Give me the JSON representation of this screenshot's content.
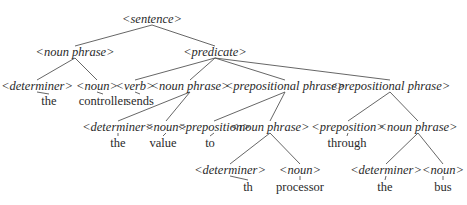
{
  "diagram": {
    "title": "",
    "type": "parse-tree",
    "line_color": "#555555",
    "text_color": "#2a2a2a",
    "nodes": [
      {
        "id": "s",
        "label": "<sentence>",
        "kind": "nt",
        "x": 152,
        "y": 19,
        "parent": null
      },
      {
        "id": "np1",
        "label": "<noun phrase>",
        "kind": "nt",
        "x": 75,
        "y": 52,
        "parent": "s"
      },
      {
        "id": "pred",
        "label": "<predicate>",
        "kind": "nt",
        "x": 215,
        "y": 52,
        "parent": "s"
      },
      {
        "id": "det1",
        "label": "<determiner>",
        "kind": "nt",
        "x": 37,
        "y": 86,
        "parent": "np1"
      },
      {
        "id": "n1",
        "label": "<noun>",
        "kind": "nt",
        "x": 97,
        "y": 86,
        "parent": "np1"
      },
      {
        "id": "w_the1",
        "label": "the",
        "kind": "leaf",
        "x": 49,
        "y": 101,
        "parent": "det1"
      },
      {
        "id": "w_ctrl",
        "label": "controller",
        "kind": "leaf",
        "x": 103,
        "y": 101,
        "parent": "n1"
      },
      {
        "id": "verb",
        "label": "<verb>",
        "kind": "nt",
        "x": 135,
        "y": 86,
        "parent": "pred"
      },
      {
        "id": "w_sends",
        "label": "sends",
        "kind": "leaf",
        "x": 140,
        "y": 101,
        "parent": "verb"
      },
      {
        "id": "np2",
        "label": "<noun phrase>",
        "kind": "nt",
        "x": 190,
        "y": 86,
        "parent": "pred"
      },
      {
        "id": "pp1",
        "label": "<prepositional phrase>",
        "kind": "nt",
        "x": 285,
        "y": 86,
        "parent": "pred"
      },
      {
        "id": "pp2",
        "label": "<prepositional phrase>",
        "kind": "nt",
        "x": 390,
        "y": 86,
        "parent": "pred"
      },
      {
        "id": "det2",
        "label": "<determiner>",
        "kind": "nt",
        "x": 118,
        "y": 127,
        "parent": "np2"
      },
      {
        "id": "n2",
        "label": "<noun>",
        "kind": "nt",
        "x": 166,
        "y": 127,
        "parent": "np2"
      },
      {
        "id": "w_the2",
        "label": "the",
        "kind": "leaf",
        "x": 118,
        "y": 143,
        "parent": "det2"
      },
      {
        "id": "w_value",
        "label": "value",
        "kind": "leaf",
        "x": 163,
        "y": 143,
        "parent": "n2"
      },
      {
        "id": "prep1",
        "label": "<preposition>",
        "kind": "nt",
        "x": 214,
        "y": 127,
        "parent": "pp1"
      },
      {
        "id": "np3",
        "label": "<noun phrase>",
        "kind": "nt",
        "x": 270,
        "y": 127,
        "parent": "pp1"
      },
      {
        "id": "w_to",
        "label": "to",
        "kind": "leaf",
        "x": 210,
        "y": 143,
        "parent": "prep1"
      },
      {
        "id": "det3",
        "label": "<determiner>",
        "kind": "nt",
        "x": 230,
        "y": 170,
        "parent": "np3"
      },
      {
        "id": "n3",
        "label": "<noun>",
        "kind": "nt",
        "x": 300,
        "y": 170,
        "parent": "np3"
      },
      {
        "id": "w_th",
        "label": "th",
        "kind": "leaf",
        "x": 248,
        "y": 187,
        "parent": "det3"
      },
      {
        "id": "w_proc",
        "label": "processor",
        "kind": "leaf",
        "x": 300,
        "y": 187,
        "parent": "n3"
      },
      {
        "id": "prep2",
        "label": "<preposition>",
        "kind": "nt",
        "x": 348,
        "y": 127,
        "parent": "pp2"
      },
      {
        "id": "np4",
        "label": "<noun phrase>",
        "kind": "nt",
        "x": 418,
        "y": 127,
        "parent": "pp2"
      },
      {
        "id": "w_through",
        "label": "through",
        "kind": "leaf",
        "x": 347,
        "y": 143,
        "parent": "prep2"
      },
      {
        "id": "det4",
        "label": "<determiner>",
        "kind": "nt",
        "x": 386,
        "y": 170,
        "parent": "np4"
      },
      {
        "id": "n4",
        "label": "<noun>",
        "kind": "nt",
        "x": 443,
        "y": 170,
        "parent": "np4"
      },
      {
        "id": "w_the3",
        "label": "the",
        "kind": "leaf",
        "x": 385,
        "y": 187,
        "parent": "det4"
      },
      {
        "id": "w_bus",
        "label": "bus",
        "kind": "leaf",
        "x": 443,
        "y": 187,
        "parent": "n4"
      }
    ]
  }
}
